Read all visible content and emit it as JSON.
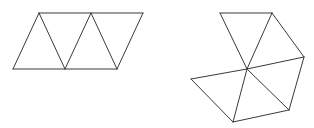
{
  "diagram": {
    "stroke_color": "#3a3a3a",
    "background": "#ffffff",
    "figures": [
      {
        "name": "strip-of-four-triangles",
        "description": "Parallelogram strip of four equilateral triangles",
        "vertices": {
          "t1": [
            39,
            13
          ],
          "t2": [
            91,
            13
          ],
          "t3": [
            143,
            13
          ],
          "b1": [
            13,
            69
          ],
          "b2": [
            65,
            69
          ],
          "b3": [
            117,
            69
          ]
        },
        "edges": [
          [
            "t1",
            "t3"
          ],
          [
            "b1",
            "b3"
          ],
          [
            "b1",
            "t1"
          ],
          [
            "t1",
            "b2"
          ],
          [
            "b2",
            "t2"
          ],
          [
            "t2",
            "b3"
          ],
          [
            "b3",
            "t3"
          ]
        ]
      },
      {
        "name": "fan-of-five-triangles",
        "description": "Five triangles sharing a common central vertex",
        "vertices": {
          "c": [
            247,
            69
          ],
          "p1": [
            220,
            13
          ],
          "p2": [
            272,
            13
          ],
          "p3": [
            304,
            57
          ],
          "p4": [
            289,
            110
          ],
          "p5": [
            233,
            122
          ],
          "p6": [
            191,
            79
          ]
        },
        "edges": [
          [
            "p1",
            "p2"
          ],
          [
            "p2",
            "p3"
          ],
          [
            "p3",
            "p4"
          ],
          [
            "p4",
            "p5"
          ],
          [
            "p5",
            "p6"
          ],
          [
            "c",
            "p1"
          ],
          [
            "c",
            "p2"
          ],
          [
            "c",
            "p3"
          ],
          [
            "c",
            "p4"
          ],
          [
            "c",
            "p5"
          ],
          [
            "c",
            "p6"
          ]
        ]
      }
    ]
  }
}
